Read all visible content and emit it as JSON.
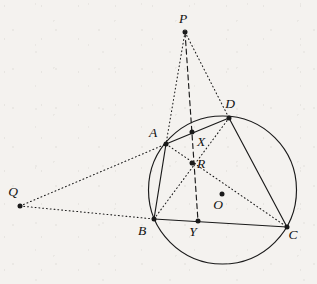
{
  "figure": {
    "kind": "euclidean-geometry-diagram",
    "caption": "",
    "background_color": "#f4f2ef",
    "stroke_color": "#1a1a1a",
    "canvas": {
      "width": 317,
      "height": 284
    }
  },
  "circle": {
    "name": "circumcircle",
    "center_label": "O",
    "center": {
      "x": 222.5,
      "y": 190
    },
    "radius": 74,
    "style": "solid"
  },
  "points": [
    {
      "id": "P",
      "label": "P",
      "x": 185,
      "y": 32,
      "label_x": 183,
      "label_y": 23,
      "on_circle": false
    },
    {
      "id": "D",
      "label": "D",
      "x": 229,
      "y": 118,
      "label_x": 230,
      "label_y": 108,
      "on_circle": true
    },
    {
      "id": "A",
      "label": "A",
      "x": 166,
      "y": 144,
      "label_x": 153,
      "label_y": 137,
      "on_circle": true
    },
    {
      "id": "X",
      "label": "X",
      "x": 192,
      "y": 132,
      "label_x": 201,
      "label_y": 146,
      "on_circle": false
    },
    {
      "id": "R",
      "label": "R",
      "x": 192,
      "y": 163,
      "label_x": 201,
      "label_y": 168,
      "on_circle": false
    },
    {
      "id": "Q",
      "label": "Q",
      "x": 20,
      "y": 206,
      "label_x": 13,
      "label_y": 196,
      "on_circle": false
    },
    {
      "id": "O",
      "label": "O",
      "x": 222,
      "y": 194,
      "label_x": 218,
      "label_y": 209,
      "on_circle": false
    },
    {
      "id": "B",
      "label": "B",
      "x": 154,
      "y": 219,
      "label_x": 142,
      "label_y": 235,
      "on_circle": true
    },
    {
      "id": "Y",
      "label": "Y",
      "x": 198,
      "y": 221,
      "label_x": 193,
      "label_y": 236,
      "on_circle": false
    },
    {
      "id": "C",
      "label": "C",
      "x": 287,
      "y": 227,
      "label_x": 293,
      "label_y": 239,
      "on_circle": true
    }
  ],
  "segments": [
    {
      "id": "AD",
      "from": "A",
      "to": "D",
      "style": "solid"
    },
    {
      "id": "AB",
      "from": "A",
      "to": "B",
      "style": "solid"
    },
    {
      "id": "BC",
      "from": "B",
      "to": "C",
      "style": "solid"
    },
    {
      "id": "DC",
      "from": "D",
      "to": "C",
      "style": "solid"
    },
    {
      "id": "AC",
      "from": "A",
      "to": "C",
      "style": "dotted"
    },
    {
      "id": "BD",
      "from": "B",
      "to": "D",
      "style": "dotted"
    },
    {
      "id": "PA",
      "from": "P",
      "to": "A",
      "style": "dotted"
    },
    {
      "id": "PD",
      "from": "P",
      "to": "D",
      "style": "dotted"
    },
    {
      "id": "QA",
      "from": "Q",
      "to": "A",
      "style": "dotted"
    },
    {
      "id": "QB",
      "from": "Q",
      "to": "B",
      "style": "dotted"
    },
    {
      "id": "PY",
      "from": "P",
      "to": "Y",
      "style": "dashed"
    }
  ]
}
